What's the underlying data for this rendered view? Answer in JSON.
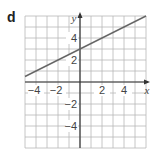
{
  "panel_label": "d",
  "colors": {
    "grid": "#b8b8b8",
    "axis": "#333333",
    "line": "#666666",
    "text": "#444444"
  },
  "chart_data": {
    "type": "line",
    "title": "",
    "xlabel": "x",
    "ylabel": "y",
    "xlim": [
      -5,
      6
    ],
    "ylim": [
      -6,
      6
    ],
    "grid": true,
    "legend": "none",
    "x_ticks": [
      -4,
      -2,
      2,
      4
    ],
    "y_ticks": [
      4,
      2,
      -2,
      -4
    ],
    "series": [
      {
        "name": "y = 0.5x + 3",
        "x": [
          -5,
          6
        ],
        "y": [
          0.5,
          6
        ]
      }
    ]
  }
}
